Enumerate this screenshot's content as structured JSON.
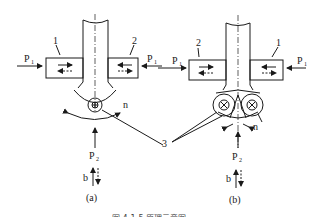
{
  "diagram": {
    "panel_a": {
      "label": "(a)",
      "part_left": "1",
      "part_right": "2",
      "force_left": "P",
      "force_left_sub": "1",
      "force_right": "P",
      "force_right_sub": "1",
      "bottom_force": "P",
      "bottom_force_sub": "2",
      "rotation_label": "n",
      "motion_label": "b"
    },
    "panel_b": {
      "label": "(b)",
      "part_left": "2",
      "part_right": "1",
      "force_left": "P",
      "force_left_sub": "1",
      "force_right": "P",
      "force_right_sub": "1",
      "bottom_force": "P",
      "bottom_force_sub": "2",
      "rotation_label": "n",
      "motion_label": "b"
    },
    "shared_label": "3",
    "caption": "图 4-1-5  原理示意图"
  }
}
